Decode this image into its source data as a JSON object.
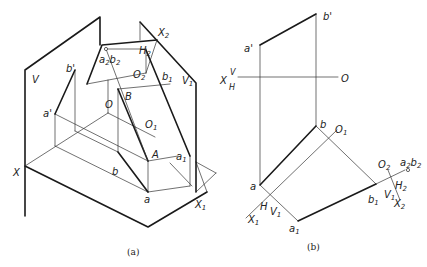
{
  "figure_a": {
    "caption": "(a)",
    "labels": {
      "V": "V",
      "V1": "V",
      "V1_sub": "1",
      "H2": "H",
      "H2_sub": "2",
      "X2": "X",
      "X2_sub": "2",
      "a2b2": "a",
      "a2b2_sub1": "2",
      "a2b2_b": "b",
      "a2b2_sub2": "2",
      "O2": "O",
      "O2_sub": "2",
      "b_prime": "b'",
      "b1_prime": "b",
      "b1_prime_sub": "1",
      "b1_prime_mark": "'",
      "B": "B",
      "O": "O",
      "a_prime": "a'",
      "O1": "O",
      "O1_sub": "1",
      "A": "A",
      "a1": "a",
      "a1_sub": "1",
      "b": "b",
      "a": "a",
      "X": "X",
      "X1": "X",
      "X1_sub": "1"
    }
  },
  "figure_b": {
    "caption": "(b)",
    "labels": {
      "b_prime": "b'",
      "a_prime": "a'",
      "X": "X",
      "V": "V",
      "H": "H",
      "O": "O",
      "b": "b",
      "O1": "O",
      "O1_sub": "1",
      "a": "a",
      "H_lower": "H",
      "V1": "V",
      "V1_sub": "1",
      "X1": "X",
      "X1_sub": "1",
      "a1": "a",
      "a1_sub": "1",
      "b1": "b",
      "b1_sub": "1",
      "O2": "O",
      "O2_sub": "2",
      "a2b2": "a",
      "a2b2_sub1": "2",
      "a2b2_b": "b",
      "a2b2_sub2": "2",
      "V1_r": "V",
      "V1_r_sub": "1",
      "H2": "H",
      "H2_sub": "2",
      "X2": "X",
      "X2_sub": "2"
    }
  }
}
